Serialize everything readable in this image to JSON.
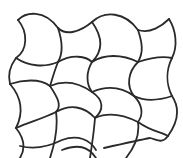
{
  "figure": {
    "stroke_color": "#2a2a2a",
    "background_color": "#ffffff",
    "grid": {
      "rows": 3,
      "cols": 3
    }
  }
}
